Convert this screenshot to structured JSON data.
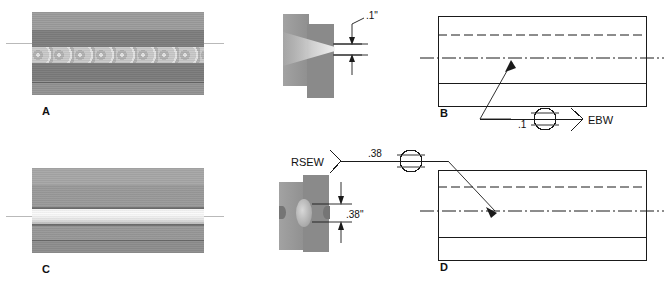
{
  "figure": {
    "panels": [
      {
        "id": "A",
        "letter": "A",
        "label": "A",
        "kind": "macrograph",
        "description": "Electron beam weld macrograph, narrow light fusion zone with nugget ripples"
      },
      {
        "id": "B",
        "letter": "B",
        "label": "B",
        "kind": "weld-symbol-drawing",
        "description": "Electron beam weld symbol drawing with leader arrow"
      },
      {
        "id": "C",
        "letter": "C",
        "label": "C",
        "kind": "macrograph",
        "description": "Resistance seam weld macrograph, wide bright fusion seam"
      },
      {
        "id": "D",
        "letter": "D",
        "label": "D",
        "kind": "weld-symbol-drawing",
        "description": "Resistance seam weld symbol drawing with leader arrow"
      }
    ]
  },
  "detail_top": {
    "dimension": ".1\"",
    "process_note": "electron beam penetration depth"
  },
  "detail_bottom": {
    "dimension": ".38\"",
    "process_note": "resistance seam weld nugget width"
  },
  "symbol_top": {
    "size": ".1",
    "process": "EBW",
    "weld_symbol": "circle-spot-weld"
  },
  "symbol_bottom": {
    "size": ".38",
    "process": "RSEW",
    "weld_symbol": "circle-seam-weld"
  },
  "colors": {
    "line": "#1a1a1a",
    "axis": "#b9b9b9",
    "metal_light": "#a7a7a7",
    "metal_dark": "#7e7e7e",
    "fusion_bright": "#fbfbfb",
    "fusion_ebw": "#cacaca"
  }
}
